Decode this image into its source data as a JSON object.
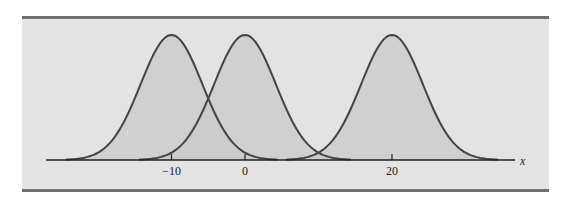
{
  "chart_data": {
    "type": "line",
    "title": "",
    "xlabel": "x",
    "ylabel": "",
    "series": [
      {
        "name": "Normal curve, mean -10",
        "mean": -10,
        "sd": 4.2
      },
      {
        "name": "Normal curve, mean 0",
        "mean": 0,
        "sd": 4.2
      },
      {
        "name": "Normal curve, mean 20",
        "mean": 20,
        "sd": 4.2
      }
    ],
    "x_ticks": [
      {
        "value": -10,
        "label": "−10"
      },
      {
        "value": 0,
        "label": "0"
      },
      {
        "value": 20,
        "label": "20"
      }
    ],
    "xlim": [
      -27,
      37
    ],
    "grid": false,
    "legend": "none",
    "colors": {
      "background": "#e3e3e3",
      "border": "#6f6f6f",
      "fill": "#c9c9c9",
      "curve": "#444444",
      "axis": "#222222"
    }
  }
}
